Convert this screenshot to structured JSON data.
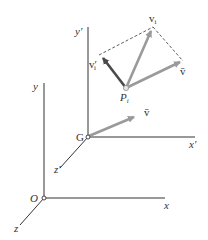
{
  "diagram": {
    "title": "",
    "colors": {
      "axis": "#333333",
      "vector_dark": "#4a4a4a",
      "vector_light": "#9a9a9a",
      "dashed": "#333333",
      "point_fill": "#ffffff"
    },
    "fixed_frame": {
      "origin_label": "O",
      "x_label": "x",
      "y_label": "y",
      "z_label": "z"
    },
    "moving_frame": {
      "origin_label": "G",
      "x_label": "x′",
      "y_label": "y′",
      "z_label": "z′",
      "vbar_at_G_label": "v̄"
    },
    "particle": {
      "point_label": "P",
      "point_sub": "i",
      "v_label": "v",
      "v_sub": "i",
      "v_rel_label": "v′",
      "v_rel_sub": "i",
      "vbar_label": "v̄"
    }
  }
}
